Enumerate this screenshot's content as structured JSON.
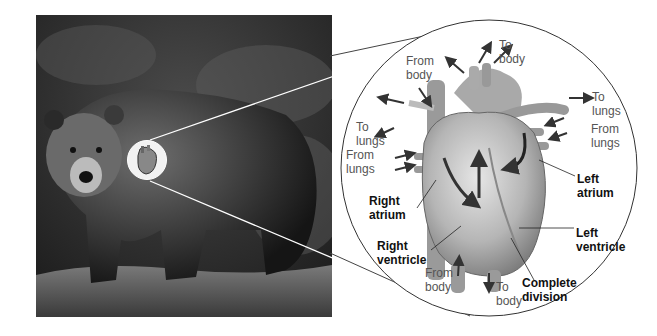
{
  "figure": {
    "subject_photo": "Brown bear standing on grassy hill",
    "magnifier_target": "heart",
    "inset_title": "Four-chambered heart"
  },
  "labels": {
    "from_body_top": "From\nbody",
    "to_body_top": "To\nbody",
    "to_lungs_right": "To\nlungs",
    "from_lungs_right": "From\nlungs",
    "to_lungs_left": "To\nlungs",
    "from_lungs_left": "From\nlungs",
    "left_atrium": "Left\natrium",
    "right_atrium": "Right\natrium",
    "left_ventricle": "Left\nventricle",
    "right_ventricle": "Right\nventricle",
    "from_body_bottom": "From\nbody",
    "to_body_bottom": "To\nbody",
    "complete_division": "Complete\ndivision"
  },
  "colors": {
    "background": "#ffffff",
    "label_gray": "#555555",
    "label_bold": "#111111",
    "arrow": "#333333"
  }
}
